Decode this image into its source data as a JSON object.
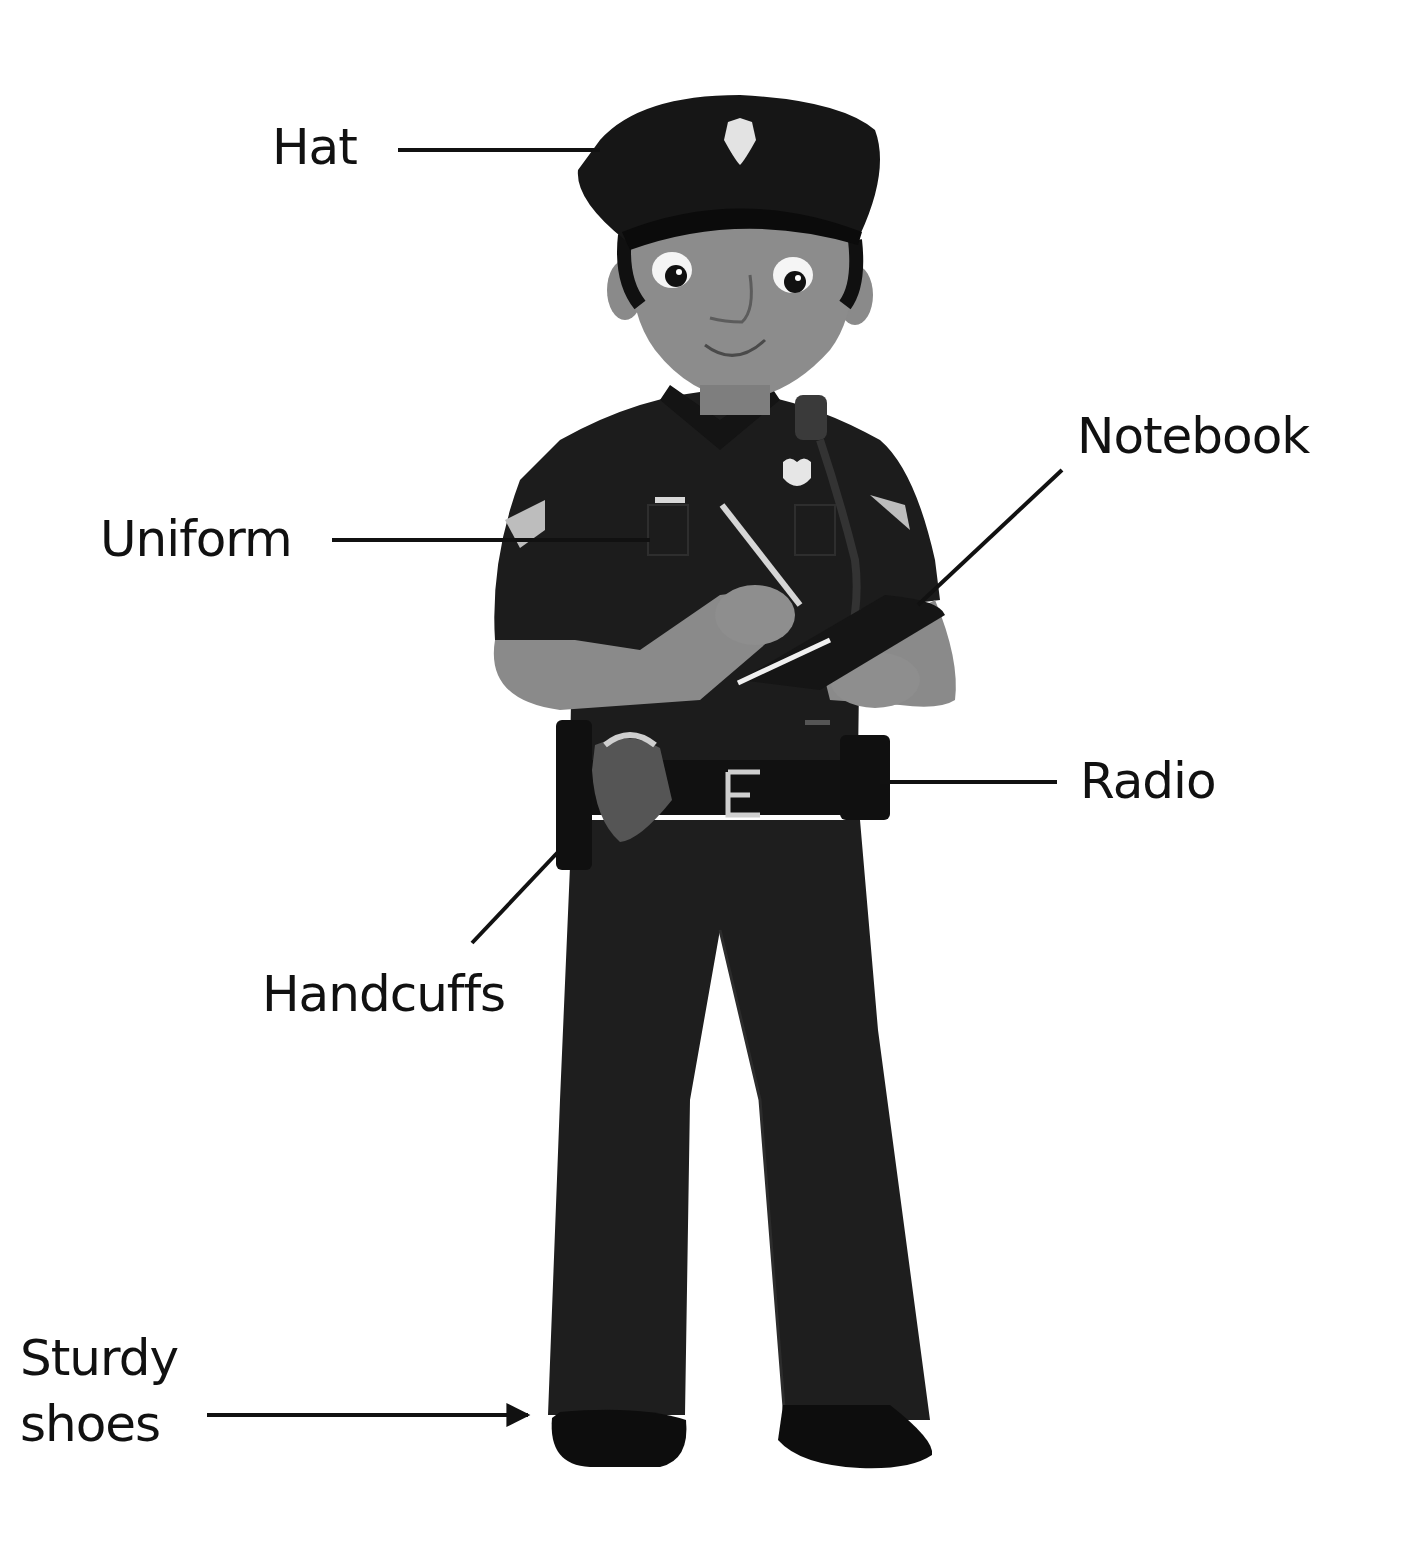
{
  "diagram": {
    "colors": {
      "background": "#ffffff",
      "ink": "#111111",
      "uniform": "#1a1a1a",
      "skin": "#8a8a8a",
      "badge": "#e6e6e6"
    },
    "labels": [
      {
        "id": "hat",
        "text": "Hat",
        "points_to": "hat"
      },
      {
        "id": "uniform",
        "text": "Uniform",
        "points_to": "shirt sleeve"
      },
      {
        "id": "notebook",
        "text": "Notebook",
        "points_to": "notebook in hand"
      },
      {
        "id": "radio",
        "text": "Radio",
        "points_to": "radio on belt"
      },
      {
        "id": "handcuffs",
        "text": "Handcuffs",
        "points_to": "handcuff pouch on belt"
      },
      {
        "id": "sturdy_shoes",
        "text": "Sturdy\nshoes",
        "points_to": "shoes"
      }
    ],
    "pointers": [
      {
        "label": "hat",
        "style": "line",
        "from": [
          398,
          150
        ],
        "to": [
          600,
          150
        ]
      },
      {
        "label": "uniform",
        "style": "line",
        "from": [
          332,
          540
        ],
        "to": [
          650,
          540
        ]
      },
      {
        "label": "notebook",
        "style": "line",
        "from": [
          1062,
          470
        ],
        "to": [
          918,
          605
        ]
      },
      {
        "label": "radio",
        "style": "line",
        "from": [
          1057,
          782
        ],
        "to": [
          880,
          782
        ]
      },
      {
        "label": "handcuffs",
        "style": "line",
        "from": [
          472,
          943
        ],
        "to": [
          558,
          852
        ]
      },
      {
        "label": "sturdy_shoes",
        "style": "arrow",
        "from": [
          207,
          1415
        ],
        "to": [
          530,
          1415
        ]
      }
    ]
  }
}
